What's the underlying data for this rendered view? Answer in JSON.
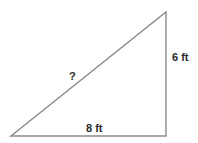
{
  "diagram": {
    "type": "right-triangle",
    "labels": {
      "hypotenuse": "?",
      "vertical_side": "6 ft",
      "base": "8 ft"
    },
    "colors": {
      "line": "#8a8a8a",
      "text": "#2a2a2a",
      "background": "#ffffff"
    }
  }
}
